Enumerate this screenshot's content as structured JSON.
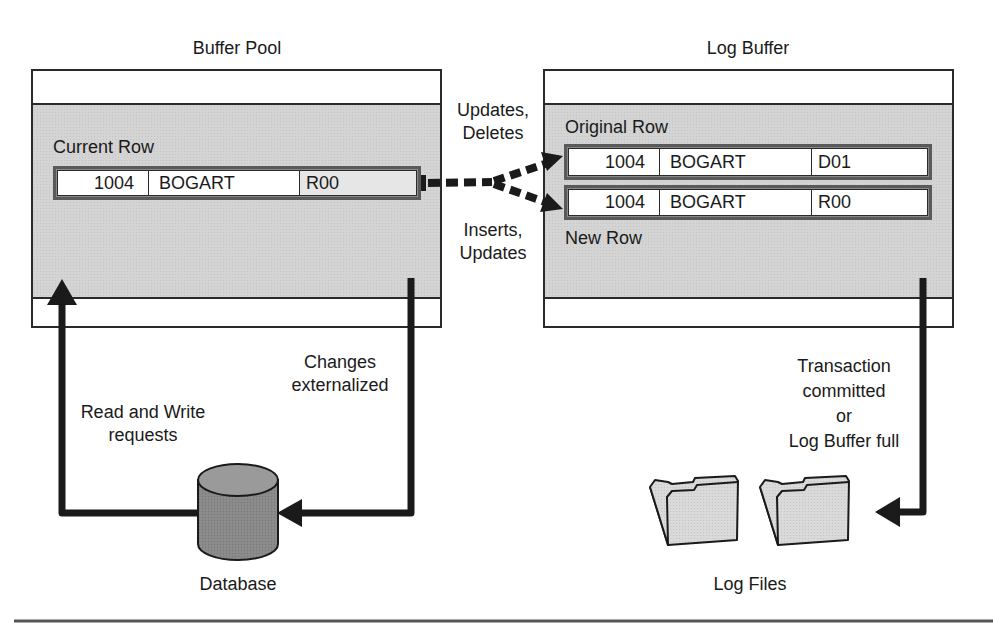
{
  "buffer_pool": {
    "title": "Buffer Pool",
    "row_label": "Current Row",
    "row": {
      "id": "1004",
      "name": "BOGART",
      "code": "R00"
    }
  },
  "log_buffer": {
    "title": "Log Buffer",
    "original_label": "Original Row",
    "original_row": {
      "id": "1004",
      "name": "BOGART",
      "code": "D01"
    },
    "new_label": "New Row",
    "new_row": {
      "id": "1004",
      "name": "BOGART",
      "code": "R00"
    }
  },
  "flow_labels": {
    "updates_deletes": [
      "Updates,",
      "Deletes"
    ],
    "inserts_updates": [
      "Inserts,",
      "Updates"
    ],
    "changes_externalized": [
      "Changes",
      "externalized"
    ],
    "read_write_requests": [
      "Read and Write",
      "requests"
    ],
    "transaction_flush": [
      "Transaction",
      "committed",
      "or",
      "Log Buffer full"
    ]
  },
  "database": {
    "label": "Database",
    "icon": "database-cylinder-icon"
  },
  "log_files": {
    "label": "Log Files",
    "icon": "folder-icon"
  },
  "colors": {
    "stroke": "#1a1a1a",
    "shade": "#d4d4d4",
    "cylinder": "#8c8c8c",
    "folder": "#d9d9d9"
  }
}
